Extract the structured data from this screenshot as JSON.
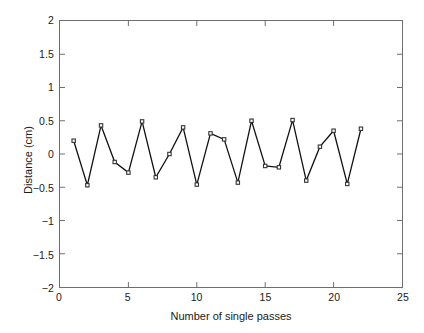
{
  "chart_data": {
    "type": "line",
    "title": "",
    "xlabel": "Number of single passes",
    "ylabel": "Distance (cm)",
    "xlim": [
      0,
      25
    ],
    "ylim": [
      -2,
      2
    ],
    "xticks": [
      0,
      5,
      10,
      15,
      20,
      25
    ],
    "xtick_labels": [
      "0",
      "5",
      "10",
      "15",
      "20",
      "25"
    ],
    "yticks": [
      -2,
      -1.5,
      -1,
      -0.5,
      0,
      0.5,
      1,
      1.5,
      2
    ],
    "ytick_labels": [
      "−2",
      "−1.5",
      "−1",
      "−0.5",
      "0",
      "0.5",
      "1",
      "1.5",
      "2"
    ],
    "grid": false,
    "legend": null,
    "marker": "square",
    "line_color": "#111111",
    "marker_color": "#333333",
    "axis_color": "#6e6e6e",
    "x": [
      1,
      2,
      3,
      4,
      5,
      6,
      7,
      8,
      9,
      10,
      11,
      12,
      13,
      14,
      15,
      16,
      17,
      18,
      19,
      20,
      21,
      22
    ],
    "values": [
      0.2,
      -0.47,
      0.43,
      -0.12,
      -0.28,
      0.49,
      -0.35,
      0.0,
      0.4,
      -0.46,
      0.31,
      0.22,
      -0.43,
      0.5,
      -0.18,
      -0.2,
      0.51,
      -0.4,
      0.11,
      0.35,
      -0.45,
      0.38
    ],
    "series": [
      {
        "name": "Distance",
        "values": [
          0.2,
          -0.47,
          0.43,
          -0.12,
          -0.28,
          0.49,
          -0.35,
          0.0,
          0.4,
          -0.46,
          0.31,
          0.22,
          -0.43,
          0.5,
          -0.18,
          -0.2,
          0.51,
          -0.4,
          0.11,
          0.35,
          -0.45,
          0.38
        ]
      }
    ]
  }
}
